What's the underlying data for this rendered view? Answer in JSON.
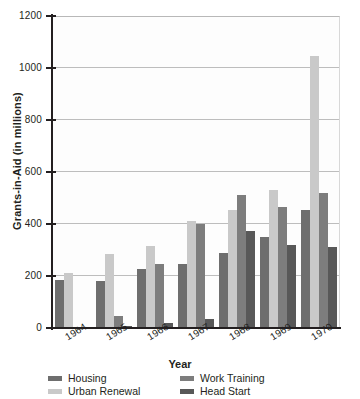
{
  "chart_data": {
    "type": "bar",
    "title": "",
    "xlabel": "Year",
    "ylabel": "Grants-in-Aid (in millions)",
    "categories": [
      "1964",
      "1965",
      "1966",
      "1967",
      "1968",
      "1969",
      "1970"
    ],
    "ylim": [
      0,
      1200
    ],
    "yticks": [
      0,
      200,
      400,
      600,
      800,
      1000,
      1200
    ],
    "ytick_labels": [
      "0",
      "200",
      "400",
      "600",
      "800",
      "1000",
      "1200"
    ],
    "grid": true,
    "legend_position": "bottom",
    "series": [
      {
        "name": "Housing",
        "color": "#6e6e6e",
        "values": [
          185,
          182,
          228,
          245,
          288,
          350,
          455
        ]
      },
      {
        "name": "Urban Renewal",
        "color": "#c9c9c9",
        "values": [
          212,
          285,
          315,
          412,
          455,
          532,
          1048
        ]
      },
      {
        "name": "Work Training",
        "color": "#7d7d7d",
        "values": [
          5,
          45,
          248,
          400,
          512,
          465,
          520
        ]
      },
      {
        "name": "Head Start",
        "color": "#585858",
        "values": [
          0,
          8,
          20,
          35,
          375,
          318,
          310
        ]
      }
    ]
  },
  "legend": {
    "entries": [
      {
        "label": "Housing"
      },
      {
        "label": "Work Training"
      },
      {
        "label": "Urban Renewal"
      },
      {
        "label": "Head Start"
      }
    ]
  }
}
